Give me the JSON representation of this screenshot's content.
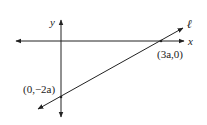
{
  "diagram": {
    "axes": {
      "x_label": "x",
      "y_label": "y"
    },
    "line": {
      "label": "ℓ",
      "x_intercept_label": "(3a,0)",
      "y_intercept_label": "(0,−2a)"
    },
    "colors": {
      "stroke": "#222222",
      "background": "#ffffff"
    }
  }
}
